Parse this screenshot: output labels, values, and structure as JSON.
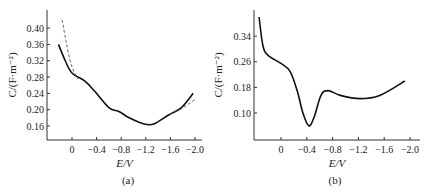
{
  "chart_data": [
    {
      "type": "line",
      "panel_label": "(a)",
      "xlabel": "E/V",
      "ylabel": "C/(F·m⁻²)",
      "xlim": [
        0.25,
        -2.05
      ],
      "ylim": [
        0.13,
        0.44
      ],
      "xticks": [
        0,
        -0.4,
        -0.8,
        -1.2,
        -1.6,
        -2.0
      ],
      "xtick_labels": [
        "0",
        "−0.4",
        "−0.8",
        "−1.2",
        "−1.6",
        "−2.0"
      ],
      "yticks": [
        0.16,
        0.2,
        0.24,
        0.28,
        0.32,
        0.36,
        0.4
      ],
      "ytick_labels": [
        "0.16",
        "0.20",
        "0.24",
        "0.28",
        "0.32",
        "0.36",
        "0.40"
      ],
      "grid": false,
      "series": [
        {
          "name": "measured",
          "style": "solid",
          "x": [
            0.22,
            0.11,
            0.0,
            -0.21,
            -0.37,
            -0.6,
            -0.77,
            -0.93,
            -1.17,
            -1.33,
            -1.57,
            -1.78,
            -1.97
          ],
          "y": [
            0.36,
            0.32,
            0.29,
            0.27,
            0.245,
            0.205,
            0.195,
            0.18,
            0.165,
            0.165,
            0.187,
            0.205,
            0.24
          ]
        },
        {
          "name": "fit-left",
          "style": "dashed",
          "x": [
            0.16,
            0.1,
            0.03,
            -0.04,
            -0.1
          ],
          "y": [
            0.42,
            0.37,
            0.32,
            0.29,
            0.275
          ]
        },
        {
          "name": "fit-right",
          "style": "dashed",
          "x": [
            -1.6,
            -1.75,
            -1.88,
            -2.0
          ],
          "y": [
            0.19,
            0.2,
            0.212,
            0.225
          ]
        }
      ]
    },
    {
      "type": "line",
      "panel_label": "(b)",
      "xlabel": "E/V",
      "ylabel": "C/(F·m⁻²)",
      "xlim": [
        0.42,
        -2.1
      ],
      "ylim": [
        0.02,
        0.42
      ],
      "xticks": [
        0,
        -0.4,
        -0.8,
        -1.2,
        -1.6,
        -2.0
      ],
      "xtick_labels": [
        "0",
        "−0.4",
        "−0.8",
        "−1.2",
        "−1.6",
        "−2.0"
      ],
      "yticks": [
        0.1,
        0.18,
        0.26,
        0.34
      ],
      "ytick_labels": [
        "0.10",
        "0.18",
        "0.26",
        "0.34"
      ],
      "grid": false,
      "series": [
        {
          "name": "measured",
          "style": "solid",
          "x": [
            0.34,
            0.28,
            0.2,
            0.0,
            -0.14,
            -0.25,
            -0.34,
            -0.43,
            -0.51,
            -0.62,
            -0.73,
            -0.92,
            -1.22,
            -1.53,
            -1.92
          ],
          "y": [
            0.4,
            0.31,
            0.28,
            0.255,
            0.23,
            0.17,
            0.1,
            0.06,
            0.085,
            0.155,
            0.17,
            0.155,
            0.145,
            0.155,
            0.2
          ]
        }
      ]
    }
  ]
}
